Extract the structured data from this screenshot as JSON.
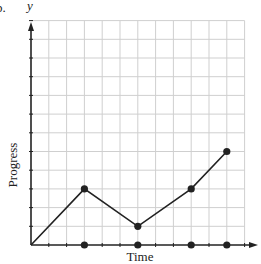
{
  "figure_label": "b.",
  "chart_data": {
    "type": "line",
    "title": "",
    "xlabel": "Time",
    "ylabel": "Progress",
    "y_axis_letter": "y",
    "x": [
      0,
      3,
      6,
      9,
      11
    ],
    "series": [
      {
        "name": "Progress",
        "values": [
          0,
          3,
          1,
          3,
          5
        ]
      }
    ],
    "x_axis_markers": [
      3,
      6,
      9,
      11
    ],
    "xlim": [
      0,
      12
    ],
    "ylim": [
      0,
      12
    ],
    "grid": true,
    "tick_labels": false,
    "colors": {
      "line": "#222222",
      "grid": "#cfcfcf",
      "axis": "#222222"
    }
  }
}
